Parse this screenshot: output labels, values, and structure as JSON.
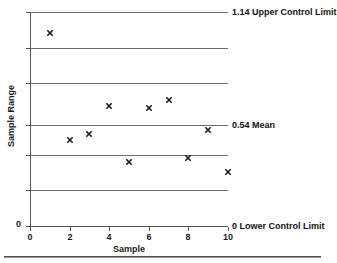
{
  "title_fragment": "t",
  "axes": {
    "x_title": "Sample",
    "y_title": "Sample Range",
    "y_zero_label": "0",
    "x_ticks": [
      "0",
      "2",
      "4",
      "6",
      "8",
      "10"
    ]
  },
  "limits": [
    {
      "name": "upper-control-limit",
      "text": "1.14 Upper Control Limit",
      "value": 1.14
    },
    {
      "name": "mean",
      "text": "0.54 Mean",
      "value": 0.54
    },
    {
      "name": "lower-control-limit",
      "text": "0 Lower Control Limit",
      "value": 0
    }
  ],
  "chart_data": {
    "type": "scatter",
    "xlabel": "Sample",
    "ylabel": "Sample Range",
    "x": [
      1,
      2,
      3,
      4,
      5,
      6,
      7,
      8,
      9,
      10
    ],
    "values": [
      1.03,
      0.46,
      0.49,
      0.64,
      0.34,
      0.63,
      0.67,
      0.36,
      0.51,
      0.29
    ],
    "xlim": [
      0,
      10
    ],
    "ylim": [
      0,
      1.14
    ],
    "xticks": [
      0,
      2,
      4,
      6,
      8,
      10
    ],
    "gridlines": [
      1.14,
      0.95,
      0.76,
      0.54,
      0.38,
      0.19,
      0
    ],
    "control_limits": {
      "ucl": 1.14,
      "mean": 0.54,
      "lcl": 0
    },
    "marker": "x",
    "grid": true,
    "legend": "none"
  }
}
